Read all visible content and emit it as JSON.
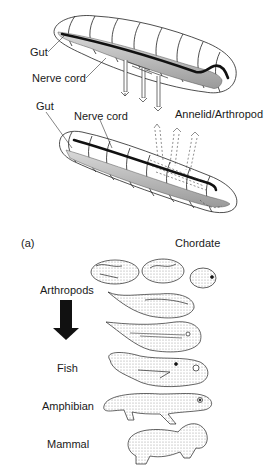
{
  "figure": {
    "panel_label": "(a)",
    "top_section": {
      "annelid_arthropod": {
        "title": "Annelid/Arthropod",
        "labels": {
          "gut": "Gut",
          "nerve_cord": "Nerve cord"
        }
      },
      "chordate": {
        "title": "Chordate",
        "labels": {
          "gut": "Gut",
          "nerve_cord": "Nerve cord"
        }
      }
    },
    "bottom_section": {
      "arrow_icon": "down-arrow",
      "row_labels": [
        "Arthropods",
        "Fish",
        "Amphibian",
        "Mammal"
      ],
      "embryo_sequence": [
        "arthropod-like embryo 1",
        "arthropod-like embryo 2",
        "arthropod-like embryo 3",
        "early elongated embryo",
        "tadpole-like embryo",
        "fish-like embryo",
        "amphibian (salamander-like)",
        "mammal (newborn rodent-like)"
      ]
    }
  }
}
